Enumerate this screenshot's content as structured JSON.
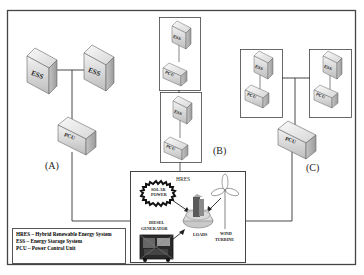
{
  "diagram": {
    "type": "network-topology",
    "configurations": [
      {
        "label": "(A)",
        "description": "Two ESS units connected to a single PCU, linked to HRES"
      },
      {
        "label": "(B)",
        "description": "Stacked ESS+PCU pairs in series, linked to HRES"
      },
      {
        "label": "(C)",
        "description": "Two ESS+PCU pairs connected to a single PCU, linked to HRES"
      }
    ],
    "nodes": {
      "ess_label": "ESS",
      "pcu_label": "PCU"
    },
    "hres": {
      "title": "HRES",
      "components": {
        "solar": "SOLAR POWER",
        "solar_line1": "SOLAR",
        "solar_line2": "POWER",
        "diesel_line1": "DIESEL",
        "diesel_line2": "GENERATOR",
        "loads": "LOADS",
        "wind_line1": "WIND",
        "wind_line2": "TURBINE"
      }
    },
    "legend": [
      "HRES – Hybrid Renewable Energy System",
      "ESS – Energy Storage System",
      "PCU – Power Control Unit"
    ],
    "colors": {
      "border": "#444444",
      "box_light": "#e8e8e8",
      "box_mid": "#c8c8c8",
      "box_dark": "#a0a0a0",
      "line": "#333333"
    }
  }
}
